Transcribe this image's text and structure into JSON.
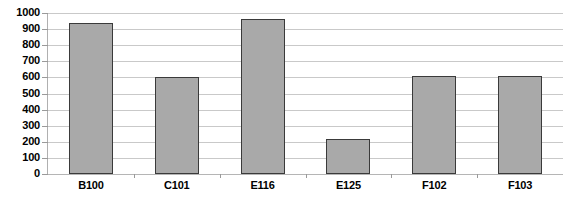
{
  "chart_data": {
    "type": "bar",
    "title": "",
    "xlabel": "",
    "ylabel": "",
    "categories": [
      "B100",
      "C101",
      "E116",
      "E125",
      "F102",
      "F103"
    ],
    "values": [
      940,
      600,
      960,
      220,
      610,
      610
    ],
    "ylim": [
      0,
      1000
    ],
    "yticks": [
      0,
      100,
      200,
      300,
      400,
      500,
      600,
      700,
      800,
      900,
      1000
    ],
    "ytick_labels": [
      "0",
      "100",
      "200",
      "300",
      "400",
      "500",
      "600",
      "700",
      "800",
      "900",
      "1000"
    ],
    "grid": true,
    "legend": false,
    "legend_position": "none",
    "bar_fill_color": "#a9a9a9",
    "bar_border_color": "#3a3a3a",
    "gridline_color": "#c9c9c9",
    "axis_color": "#b0b0b0",
    "background_color": "#ffffff",
    "text_color": "#000000"
  }
}
